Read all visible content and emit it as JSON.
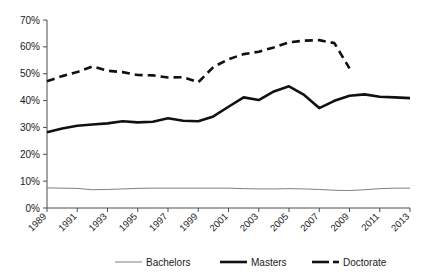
{
  "chart_data": {
    "type": "line",
    "title": "",
    "subtitle": "",
    "xlabel": "",
    "ylabel": "",
    "xlim": [
      1989,
      2013
    ],
    "ylim": [
      0,
      70
    ],
    "grid": false,
    "legend_position": "bottom",
    "x": [
      1989,
      1990,
      1991,
      1992,
      1993,
      1994,
      1995,
      1996,
      1997,
      1998,
      1999,
      2000,
      2001,
      2002,
      2003,
      2004,
      2005,
      2006,
      2007,
      2008,
      2009,
      2010,
      2011,
      2012,
      2013
    ],
    "y_ticks": [
      0,
      10,
      20,
      30,
      40,
      50,
      60,
      70
    ],
    "y_tick_labels": [
      "0%",
      "10%",
      "20%",
      "30%",
      "40%",
      "50%",
      "60%",
      "70%"
    ],
    "x_tick_labels": [
      "1989",
      "1991",
      "1993",
      "1995",
      "1997",
      "1999",
      "2001",
      "2003",
      "2005",
      "2007",
      "2009",
      "2011",
      "2013"
    ],
    "series": [
      {
        "name": "Bachelors",
        "color": "#7f7f7f",
        "style": "solid",
        "width": 1,
        "values": [
          7.5,
          7.4,
          7.3,
          6.8,
          6.9,
          7.1,
          7.3,
          7.4,
          7.4,
          7.4,
          7.4,
          7.4,
          7.4,
          7.2,
          7.1,
          7.1,
          7.2,
          7.1,
          6.9,
          6.6,
          6.5,
          6.8,
          7.2,
          7.4,
          7.4
        ]
      },
      {
        "name": "Masters",
        "color": "#111111",
        "style": "solid",
        "width": 2.6,
        "values": [
          28.2,
          29.6,
          30.6,
          31.1,
          31.5,
          32.3,
          31.9,
          32.1,
          33.4,
          32.5,
          32.3,
          34.1,
          37.7,
          41.2,
          40.2,
          43.4,
          45.3,
          42.1,
          37.2,
          39.9,
          41.8,
          42.3,
          41.4,
          41.2,
          40.9
        ]
      },
      {
        "name": "Doctorate",
        "color": "#111111",
        "style": "dashed",
        "width": 2.6,
        "values": [
          47.2,
          49.1,
          50.6,
          52.7,
          51.1,
          50.6,
          49.5,
          49.4,
          48.6,
          48.7,
          46.8,
          52.5,
          55.4,
          57.3,
          58.2,
          59.8,
          61.7,
          62.3,
          62.5,
          61.4,
          52.0,
          null,
          null,
          null,
          null
        ]
      }
    ]
  },
  "legend": {
    "items": [
      {
        "label": "Bachelors",
        "swatch": "line-thin-gray"
      },
      {
        "label": "Masters",
        "swatch": "line-thick-black"
      },
      {
        "label": "Doctorate",
        "swatch": "line-dashed-black"
      }
    ]
  }
}
